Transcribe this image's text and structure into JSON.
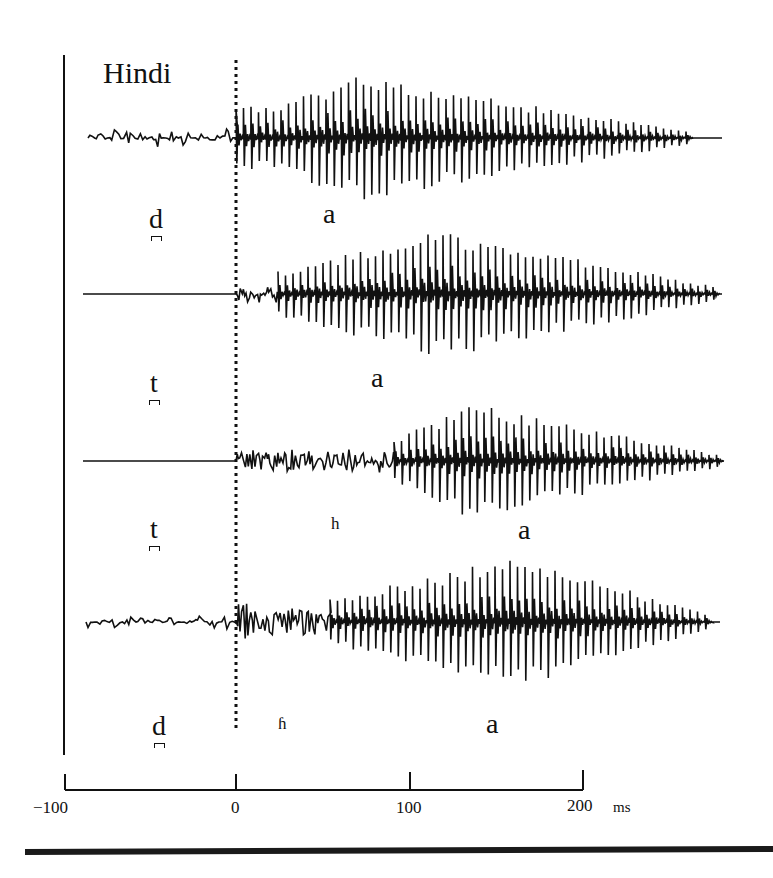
{
  "title": "Hindi",
  "chart_data": {
    "type": "line",
    "title": "Hindi",
    "xlabel": "ms",
    "xlim": [
      -100,
      220
    ],
    "x_ticks": [
      -100,
      0,
      100,
      200
    ],
    "x_tick_labels": [
      "−100",
      "0",
      "100",
      "200"
    ],
    "x_unit": "ms",
    "release_marker_x": 0,
    "grid": false,
    "series": [
      {
        "name": "d̪ a (voiced unaspirated)",
        "consonant": "d",
        "segments": [
          {
            "label": "a",
            "start_ms": 0,
            "end_ms": 260
          }
        ],
        "prevoicing_ms": [
          -85,
          0
        ],
        "burst_ms": 0,
        "vowel_onset_ms": 0,
        "vowel_end_ms": 260,
        "peak_amplitude_ms": 70
      },
      {
        "name": "t̪ a (voiceless unaspirated)",
        "consonant": "t",
        "segments": [
          {
            "label": "a",
            "start_ms": 25,
            "end_ms": 280
          }
        ],
        "prevoicing_ms": null,
        "burst_ms": 0,
        "vowel_onset_ms": 25,
        "vowel_end_ms": 280,
        "peak_amplitude_ms": 120
      },
      {
        "name": "t̪ʰ a (voiceless aspirated)",
        "consonant": "t",
        "segments": [
          {
            "label": "h",
            "start_ms": 0,
            "end_ms": 90
          },
          {
            "label": "a",
            "start_ms": 90,
            "end_ms": 280
          }
        ],
        "prevoicing_ms": null,
        "burst_ms": 0,
        "aspiration_ms": [
          0,
          90
        ],
        "vowel_onset_ms": 90,
        "vowel_end_ms": 280,
        "peak_amplitude_ms": 130
      },
      {
        "name": "d̪ʱ a (voiced aspirated / breathy)",
        "consonant": "d",
        "segments": [
          {
            "label": "ɦ",
            "start_ms": 0,
            "end_ms": 70
          },
          {
            "label": "a",
            "start_ms": 70,
            "end_ms": 265
          }
        ],
        "prevoicing_ms": [
          -85,
          0
        ],
        "burst_ms": 0,
        "breathy_ms": [
          0,
          70
        ],
        "vowel_onset_ms": 70,
        "vowel_end_ms": 265,
        "peak_amplitude_ms": 150
      }
    ]
  },
  "labels": {
    "rows": [
      {
        "consonant": "d",
        "seg1": "a"
      },
      {
        "consonant": "t",
        "seg1": "a"
      },
      {
        "consonant": "t",
        "seg1": "h",
        "seg2": "a"
      },
      {
        "consonant": "d",
        "seg1": "ɦ",
        "seg2": "a"
      }
    ],
    "axis_unit": "ms",
    "ticks": [
      "−100",
      "0",
      "100",
      "200"
    ]
  },
  "style": {
    "ink": "#111111",
    "background": "#ffffff"
  },
  "waves": [
    {
      "center_y": 138,
      "pre_type": "voiced",
      "pre_start_x": 88,
      "on_x": 236,
      "vow_x": 236,
      "peak_x": 360,
      "end_x": 690,
      "tail_end_x": 722,
      "amp": 62,
      "pre_amp": 9,
      "asp_amp": 0,
      "seed": 11
    },
    {
      "center_y": 294,
      "pre_type": "flat",
      "pre_start_x": 83,
      "on_x": 236,
      "vow_x": 278,
      "peak_x": 440,
      "end_x": 720,
      "tail_end_x": 722,
      "amp": 64,
      "pre_amp": 0,
      "asp_amp": 8,
      "seed": 23
    },
    {
      "center_y": 461,
      "pre_type": "flat",
      "pre_start_x": 83,
      "on_x": 236,
      "vow_x": 394,
      "peak_x": 470,
      "end_x": 720,
      "tail_end_x": 722,
      "amp": 58,
      "pre_amp": 0,
      "asp_amp": 9,
      "seed": 37
    },
    {
      "center_y": 622,
      "pre_type": "voiced",
      "pre_start_x": 86,
      "on_x": 236,
      "vow_x": 330,
      "peak_x": 520,
      "end_x": 710,
      "tail_end_x": 720,
      "amp": 66,
      "pre_amp": 7,
      "asp_amp": 14,
      "seed": 51
    }
  ]
}
